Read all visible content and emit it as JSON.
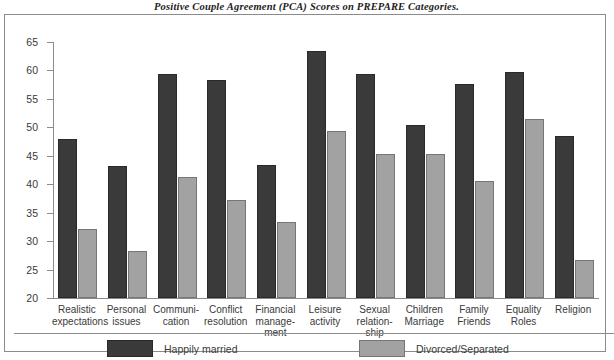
{
  "chart_data": {
    "type": "bar",
    "title": "Positive Couple Agreement (PCA) Scores on PREPARE Categories.",
    "xlabel": "",
    "ylabel": "",
    "ylim": [
      20,
      65
    ],
    "ytick_step": 5,
    "yticks": [
      65,
      60,
      55,
      50,
      45,
      40,
      35,
      30,
      25,
      20
    ],
    "grid": false,
    "legend_position": "bottom-left",
    "categories": [
      "Realistic expectations",
      "Personal issues",
      "Communi-cation",
      "Conflict resolution",
      "Financial manage-ment",
      "Leisure activity",
      "Sexual relation-ship",
      "Children Marriage",
      "Family Friends",
      "Equality Roles",
      "Religion"
    ],
    "category_lines": [
      [
        "Realistic",
        "expectations"
      ],
      [
        "Personal",
        "issues"
      ],
      [
        "Communi-",
        "cation"
      ],
      [
        "Conflict",
        "resolution"
      ],
      [
        "Financial",
        "manage-",
        "ment"
      ],
      [
        "Leisure",
        "activity"
      ],
      [
        "Sexual",
        "relation-",
        "ship"
      ],
      [
        "Children",
        "Marriage"
      ],
      [
        "Family",
        "Friends"
      ],
      [
        "Equality",
        "Roles"
      ],
      [
        "Religion"
      ]
    ],
    "series": [
      {
        "name": "Happily married",
        "color": "#3a3a3a",
        "values": [
          48.0,
          43.2,
          59.4,
          58.3,
          43.3,
          63.5,
          59.4,
          50.5,
          57.7,
          59.8,
          48.5
        ]
      },
      {
        "name": "Divorced/Separated",
        "color": "#a2a2a2",
        "values": [
          32.1,
          28.3,
          41.3,
          37.3,
          33.4,
          49.3,
          45.3,
          45.3,
          40.6,
          51.4,
          26.7
        ]
      }
    ]
  },
  "legend": {
    "items": [
      {
        "label": "Happily married",
        "swatch": "dark"
      },
      {
        "label": "Divorced/Separated",
        "swatch": "light"
      }
    ]
  }
}
